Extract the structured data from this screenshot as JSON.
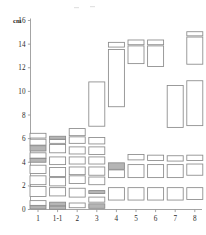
{
  "chart_data": {
    "type": "bar",
    "title": "",
    "subtitle": "",
    "xlabel": "",
    "ylabel": "cm",
    "ylim": [
      0,
      16
    ],
    "yticks": [
      0,
      2,
      4,
      6,
      8,
      10,
      12,
      14,
      16
    ],
    "ytick_labels": [
      "0",
      "2",
      "4",
      "6",
      "8",
      "10",
      "12",
      "14",
      "16"
    ],
    "categories": [
      "1",
      "1-1",
      "2",
      "3",
      "4",
      "5",
      "6",
      "7",
      "8"
    ],
    "grid": false,
    "legend": null,
    "annotations": [],
    "note": "Each category is a stack of open rectangles spanning vertical value ranges (low-high in cm). Some rectangles are shaded grey, most are unfilled outlines.",
    "box_fill_light": "#ffffff",
    "box_fill_shaded": "#b5b5b5",
    "box_stroke": "#8a8a8a",
    "axis_color": "#9a9a9a",
    "series": [
      {
        "name": "1",
        "boxes": [
          {
            "low": 6.05,
            "high": 6.45,
            "shaded": false
          },
          {
            "low": 5.45,
            "high": 5.95,
            "shaded": false
          },
          {
            "low": 4.95,
            "high": 5.4,
            "shaded": true
          },
          {
            "low": 4.35,
            "high": 4.8,
            "shaded": false
          },
          {
            "low": 4.0,
            "high": 4.32,
            "shaded": true
          },
          {
            "low": 3.05,
            "high": 3.75,
            "shaded": false
          },
          {
            "low": 2.1,
            "high": 2.85,
            "shaded": false
          },
          {
            "low": 1.1,
            "high": 1.95,
            "shaded": false
          },
          {
            "low": 0.35,
            "high": 0.75,
            "shaded": false
          },
          {
            "low": 0.05,
            "high": 0.32,
            "shaded": true
          }
        ]
      },
      {
        "name": "1-1",
        "boxes": [
          {
            "low": 5.95,
            "high": 6.2,
            "shaded": true
          },
          {
            "low": 5.6,
            "high": 5.92,
            "shaded": false
          },
          {
            "low": 4.8,
            "high": 5.5,
            "shaded": false
          },
          {
            "low": 3.8,
            "high": 4.45,
            "shaded": false
          },
          {
            "low": 2.8,
            "high": 3.55,
            "shaded": false
          },
          {
            "low": 2.0,
            "high": 2.7,
            "shaded": false
          },
          {
            "low": 1.15,
            "high": 1.85,
            "shaded": false
          },
          {
            "low": 0.3,
            "high": 0.62,
            "shaded": true
          },
          {
            "low": 0.02,
            "high": 0.28,
            "shaded": true
          }
        ]
      },
      {
        "name": "2",
        "boxes": [
          {
            "low": 6.25,
            "high": 6.85,
            "shaded": false
          },
          {
            "low": 5.6,
            "high": 6.15,
            "shaded": false
          },
          {
            "low": 4.7,
            "high": 5.3,
            "shaded": false
          },
          {
            "low": 3.85,
            "high": 4.45,
            "shaded": false
          },
          {
            "low": 2.95,
            "high": 3.6,
            "shaded": false
          },
          {
            "low": 2.2,
            "high": 2.85,
            "shaded": false
          },
          {
            "low": 1.05,
            "high": 1.8,
            "shaded": false
          },
          {
            "low": 0.15,
            "high": 0.55,
            "shaded": false
          }
        ]
      },
      {
        "name": "3",
        "boxes": [
          {
            "low": 7.05,
            "high": 10.8,
            "shaded": false
          },
          {
            "low": 5.55,
            "high": 6.1,
            "shaded": false
          },
          {
            "low": 4.65,
            "high": 5.3,
            "shaded": false
          },
          {
            "low": 3.85,
            "high": 4.45,
            "shaded": false
          },
          {
            "low": 2.9,
            "high": 3.6,
            "shaded": false
          },
          {
            "low": 2.1,
            "high": 2.75,
            "shaded": false
          },
          {
            "low": 1.35,
            "high": 1.6,
            "shaded": true
          },
          {
            "low": 0.62,
            "high": 1.05,
            "shaded": false
          },
          {
            "low": 0.1,
            "high": 0.48,
            "shaded": true
          }
        ]
      },
      {
        "name": "4",
        "boxes": [
          {
            "low": 13.75,
            "high": 14.15,
            "shaded": false
          },
          {
            "low": 8.7,
            "high": 13.55,
            "shaded": false
          },
          {
            "low": 3.4,
            "high": 3.95,
            "shaded": true
          },
          {
            "low": 2.7,
            "high": 3.35,
            "shaded": false
          },
          {
            "low": 0.8,
            "high": 1.85,
            "shaded": false
          }
        ]
      },
      {
        "name": "5",
        "boxes": [
          {
            "low": 13.95,
            "high": 14.35,
            "shaded": false
          },
          {
            "low": 12.35,
            "high": 13.85,
            "shaded": false
          },
          {
            "low": 4.2,
            "high": 4.65,
            "shaded": false
          },
          {
            "low": 2.7,
            "high": 3.8,
            "shaded": false
          },
          {
            "low": 0.8,
            "high": 1.85,
            "shaded": false
          }
        ]
      },
      {
        "name": "6",
        "boxes": [
          {
            "low": 13.95,
            "high": 14.35,
            "shaded": false
          },
          {
            "low": 12.1,
            "high": 13.85,
            "shaded": false
          },
          {
            "low": 4.15,
            "high": 4.6,
            "shaded": false
          },
          {
            "low": 2.7,
            "high": 3.8,
            "shaded": false
          },
          {
            "low": 0.8,
            "high": 1.85,
            "shaded": false
          }
        ]
      },
      {
        "name": "7",
        "boxes": [
          {
            "low": 6.95,
            "high": 10.5,
            "shaded": false
          },
          {
            "low": 4.1,
            "high": 4.55,
            "shaded": false
          },
          {
            "low": 2.7,
            "high": 3.8,
            "shaded": false
          },
          {
            "low": 0.8,
            "high": 1.85,
            "shaded": false
          }
        ]
      },
      {
        "name": "8",
        "boxes": [
          {
            "low": 14.7,
            "high": 15.05,
            "shaded": false
          },
          {
            "low": 12.3,
            "high": 14.6,
            "shaded": false
          },
          {
            "low": 7.1,
            "high": 10.9,
            "shaded": false
          },
          {
            "low": 4.15,
            "high": 4.6,
            "shaded": false
          },
          {
            "low": 2.9,
            "high": 3.85,
            "shaded": false
          },
          {
            "low": 0.85,
            "high": 1.85,
            "shaded": false
          }
        ]
      }
    ]
  }
}
